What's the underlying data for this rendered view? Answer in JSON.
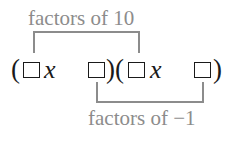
{
  "diagram": {
    "top_label": "factors of 10",
    "bottom_label": "factors of −1",
    "expression": {
      "open_paren_1": "(",
      "variable_1": "x",
      "close_open_paren": ")(",
      "variable_2": "x",
      "close_paren_2": ")",
      "blanks": [
        "□",
        "□",
        "□",
        "□"
      ]
    },
    "colors": {
      "annotation": "#8c8c8c",
      "expression": "#1a1a1a",
      "background": "#ffffff"
    }
  }
}
